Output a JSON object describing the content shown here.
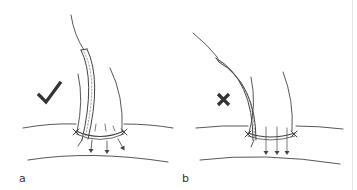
{
  "figure": {
    "panels": [
      {
        "id": "a",
        "label": "a",
        "verdict": "correct",
        "verdict_symbol": "check-mark",
        "description": "Catheter placed perpendicular through the incision with sutures around; arrows show downward drainage"
      },
      {
        "id": "b",
        "label": "b",
        "verdict": "incorrect",
        "verdict_symbol": "cross-mark",
        "description": "Catheter angled obliquely through the incision; arrows show downward drainage"
      }
    ],
    "colors": {
      "line": "#444444",
      "mark": "#333333",
      "background": "#ffffff"
    }
  }
}
